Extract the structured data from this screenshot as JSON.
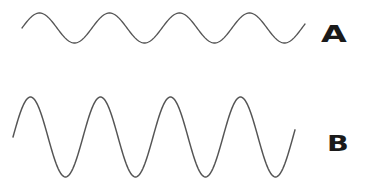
{
  "diagram": {
    "stroke_color": "#555555",
    "waves": [
      {
        "label": "A",
        "amplitude_px": 15,
        "period_px": 70,
        "center_y": 28,
        "x_start": 22,
        "x_end": 305,
        "cycles": 4
      },
      {
        "label": "B",
        "amplitude_px": 40,
        "period_px": 70,
        "center_y": 137,
        "x_start": 13,
        "x_end": 295,
        "cycles": 4
      }
    ]
  }
}
